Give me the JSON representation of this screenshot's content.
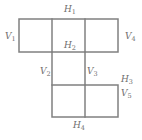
{
  "figure": {
    "name": "labeled-polyomino-diagram",
    "background_color": "#ffffff",
    "line_color": "#808080",
    "label_color": "#6e6e6e",
    "line_width": 1.5,
    "width": 142,
    "height": 140
  },
  "labels": {
    "h1": {
      "base": "H",
      "sub": "1",
      "x": 64,
      "y": 5
    },
    "h2": {
      "base": "H",
      "sub": "2",
      "x": 64,
      "y": 41
    },
    "h3": {
      "base": "H",
      "sub": "3",
      "x": 121,
      "y": 75
    },
    "h4": {
      "base": "H",
      "sub": "4",
      "x": 73,
      "y": 121
    },
    "v1": {
      "base": "V",
      "sub": "1",
      "x": 5,
      "y": 32
    },
    "v2": {
      "base": "V",
      "sub": "2",
      "x": 40,
      "y": 67
    },
    "v3": {
      "base": "V",
      "sub": "3",
      "x": 87,
      "y": 67
    },
    "v4": {
      "base": "V",
      "sub": "4",
      "x": 125,
      "y": 32
    },
    "v5": {
      "base": "V",
      "sub": "5",
      "x": 121,
      "y": 89
    }
  },
  "geometry": {
    "top_block": {
      "x": 19,
      "y": 19,
      "width": 99,
      "height": 33,
      "columns": 3
    },
    "bottom_block": {
      "x": 52,
      "y": 85,
      "width": 66,
      "height": 32,
      "columns": 2
    },
    "connectors": [
      {
        "x": 52,
        "y1": 52,
        "y2": 85
      },
      {
        "x": 85,
        "y1": 52,
        "y2": 85
      }
    ]
  }
}
